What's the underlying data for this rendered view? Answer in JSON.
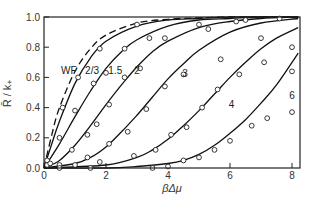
{
  "chart_data": {
    "type": "line",
    "title": "",
    "xlabel": "βΔμ",
    "ylabel": "R̄ / k₊",
    "xlim": [
      0,
      8.2
    ],
    "ylim": [
      0,
      1.0
    ],
    "grid": false,
    "legend": "inline curve labels",
    "x_ticks": [
      0,
      2,
      4,
      6,
      8
    ],
    "x_tick_labels": [
      "0",
      "2",
      "4",
      "6",
      "8"
    ],
    "y_ticks": [
      0.0,
      0.2,
      0.4,
      0.6,
      0.8,
      1.0
    ],
    "y_tick_labels": [
      "0.0",
      "0.2",
      "0.4",
      "0.6",
      "0.8",
      "1.0"
    ],
    "series": [
      {
        "name": "WF",
        "style": "dashed",
        "x": [
          0,
          0.25,
          0.5,
          1.0,
          1.5,
          2.0,
          3.0,
          4.0,
          5.0,
          6.0,
          7.0,
          8.2
        ],
        "values": [
          0,
          0.22,
          0.4,
          0.64,
          0.79,
          0.88,
          0.96,
          0.985,
          0.995,
          1.0,
          1.0,
          1.0
        ],
        "points": []
      },
      {
        "name": "2/3",
        "style": "solid",
        "x": [
          0,
          0.25,
          0.5,
          1.0,
          1.5,
          2.0,
          3.0,
          4.0,
          5.0,
          6.0,
          7.0,
          8.2
        ],
        "values": [
          0,
          0.16,
          0.31,
          0.56,
          0.73,
          0.84,
          0.94,
          0.98,
          0.99,
          1.0,
          1.0,
          1.0
        ],
        "points_x": [
          0.1,
          0.6,
          1.1,
          1.8,
          3.0
        ],
        "points_y": [
          0.05,
          0.4,
          0.6,
          0.79,
          0.95
        ]
      },
      {
        "name": "1.5",
        "style": "solid",
        "x": [
          0,
          0.5,
          1.0,
          1.5,
          2.0,
          2.5,
          3.0,
          4.0,
          5.0,
          6.0,
          7.0,
          8.2
        ],
        "values": [
          0,
          0.16,
          0.34,
          0.51,
          0.66,
          0.77,
          0.85,
          0.94,
          0.98,
          0.99,
          1.0,
          1.0
        ],
        "points_x": [
          0.1,
          0.5,
          1.0,
          1.6,
          2.0,
          2.6,
          3.4,
          5.0,
          6.5,
          7.6
        ],
        "points_y": [
          0.02,
          0.2,
          0.38,
          0.56,
          0.63,
          0.79,
          0.86,
          0.95,
          0.98,
          0.99
        ]
      },
      {
        "name": "2",
        "style": "solid",
        "x": [
          0,
          0.5,
          1.0,
          1.5,
          2.0,
          2.5,
          3.0,
          3.5,
          4.0,
          5.0,
          6.0,
          7.0,
          8.2
        ],
        "values": [
          0,
          0.05,
          0.15,
          0.28,
          0.42,
          0.55,
          0.67,
          0.77,
          0.84,
          0.93,
          0.97,
          0.99,
          1.0
        ],
        "points_x": [
          0.2,
          0.9,
          1.4,
          1.7,
          2.1,
          2.6,
          3.1,
          3.9,
          5.3,
          6.2
        ],
        "points_y": [
          0.03,
          0.12,
          0.22,
          0.29,
          0.42,
          0.6,
          0.66,
          0.86,
          0.92,
          0.97
        ]
      },
      {
        "name": "3",
        "style": "solid",
        "x": [
          0,
          1.0,
          1.5,
          2.0,
          2.5,
          3.0,
          3.5,
          4.0,
          4.5,
          5.0,
          6.0,
          7.0,
          8.2
        ],
        "values": [
          0,
          0.03,
          0.07,
          0.14,
          0.24,
          0.35,
          0.47,
          0.59,
          0.69,
          0.78,
          0.9,
          0.96,
          0.99
        ],
        "points_x": [
          0.5,
          1.4,
          2.1,
          2.7,
          3.3,
          3.9,
          4.5,
          5.7,
          7.0,
          8.0
        ],
        "points_y": [
          0.02,
          0.07,
          0.16,
          0.24,
          0.39,
          0.54,
          0.62,
          0.72,
          0.86,
          0.8
        ]
      },
      {
        "name": "4",
        "style": "solid",
        "x": [
          0,
          2.0,
          3.0,
          3.5,
          4.0,
          4.5,
          5.0,
          5.5,
          6.0,
          6.5,
          7.0,
          7.5,
          8.2
        ],
        "values": [
          0,
          0.02,
          0.07,
          0.12,
          0.19,
          0.28,
          0.38,
          0.49,
          0.6,
          0.7,
          0.79,
          0.86,
          0.93
        ],
        "points_x": [
          1.0,
          1.8,
          2.9,
          3.6,
          4.1,
          4.6,
          5.1,
          5.6,
          6.3,
          7.1,
          8.0
        ],
        "points_y": [
          0.02,
          0.04,
          0.08,
          0.12,
          0.22,
          0.27,
          0.4,
          0.52,
          0.62,
          0.7,
          0.64
        ]
      },
      {
        "name": "6",
        "style": "solid",
        "x": [
          0,
          2.0,
          3.0,
          4.0,
          4.5,
          5.0,
          5.5,
          6.0,
          6.5,
          7.0,
          7.5,
          8.2
        ],
        "values": [
          0,
          0.0,
          0.01,
          0.03,
          0.05,
          0.09,
          0.15,
          0.23,
          0.32,
          0.43,
          0.55,
          0.76
        ],
        "points_x": [
          0.5,
          1.5,
          3.5,
          4.0,
          4.5,
          5.0,
          5.5,
          6.0,
          6.7,
          7.2,
          8.0
        ],
        "points_y": [
          0.0,
          0.0,
          0.0,
          0.01,
          0.05,
          0.07,
          0.12,
          0.18,
          0.28,
          0.33,
          0.37
        ]
      }
    ]
  },
  "labels": {
    "xlabel": "βΔμ",
    "ylabel": "R̄ / k₊",
    "curve_labels": [
      {
        "text": "WF",
        "x": 0.8,
        "y": 0.62
      },
      {
        "text": "2/3",
        "x": 1.55,
        "y": 0.62
      },
      {
        "text": "1.5",
        "x": 2.3,
        "y": 0.62
      },
      {
        "text": "2",
        "x": 3.0,
        "y": 0.62
      },
      {
        "text": "3",
        "x": 4.55,
        "y": 0.6
      },
      {
        "text": "4",
        "x": 6.05,
        "y": 0.4
      },
      {
        "text": "6",
        "x": 8.0,
        "y": 0.46
      }
    ]
  }
}
